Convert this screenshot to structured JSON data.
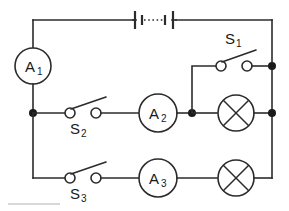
{
  "diagram": {
    "type": "circuit-schematic",
    "colors": {
      "wire": "#2b2b2b",
      "background": "#ffffff",
      "node": "#1a1a1a",
      "label": "#1a1a1a"
    }
  },
  "components": {
    "battery": {
      "name": "battery",
      "symbol": "multi-cell-battery",
      "cells_indicated": "series cells with ellipsis gap"
    },
    "ammeters": [
      {
        "id": "A1",
        "letter": "A",
        "subscript": "1"
      },
      {
        "id": "A2",
        "letter": "A",
        "subscript": "2"
      },
      {
        "id": "A3",
        "letter": "A",
        "subscript": "3"
      }
    ],
    "switches": [
      {
        "id": "S1",
        "letter": "S",
        "subscript": "1",
        "state": "open"
      },
      {
        "id": "S2",
        "letter": "S",
        "subscript": "2",
        "state": "open"
      },
      {
        "id": "S3",
        "letter": "S",
        "subscript": "3",
        "state": "open"
      }
    ],
    "lamps": [
      {
        "id": "L1",
        "symbol": "crossed-circle-lamp"
      },
      {
        "id": "L2",
        "symbol": "crossed-circle-lamp"
      }
    ],
    "junction_count": 5
  }
}
